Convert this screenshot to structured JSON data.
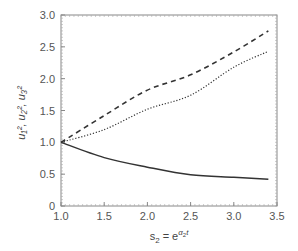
{
  "chart_data": {
    "type": "line",
    "title": "",
    "xlabel": "s2 = e^(α2 t)",
    "ylabel": "u1², u2², u3²",
    "xlim": [
      1.0,
      3.5
    ],
    "ylim": [
      0,
      3.0
    ],
    "xticks": [
      "1.0",
      "1.5",
      "2.0",
      "2.5",
      "3.0",
      "3.5"
    ],
    "yticks": [
      "0",
      "0.5",
      "1.0",
      "1.5",
      "2.0",
      "2.5",
      "3.0"
    ],
    "grid": false,
    "legend": null,
    "x": [
      1.0,
      1.5,
      2.0,
      2.5,
      3.0,
      3.4
    ],
    "series": [
      {
        "name": "dashed",
        "style": "dashed",
        "values": [
          1.0,
          1.42,
          1.82,
          2.06,
          2.42,
          2.75
        ]
      },
      {
        "name": "dotted",
        "style": "dotted",
        "values": [
          1.0,
          1.2,
          1.52,
          1.74,
          2.18,
          2.43
        ]
      },
      {
        "name": "solid",
        "style": "solid",
        "values": [
          1.0,
          0.76,
          0.61,
          0.49,
          0.45,
          0.42
        ]
      }
    ]
  },
  "axes": {
    "xlabel_main": "s",
    "xlabel_sub": "2",
    "xlabel_eq": " = e",
    "xlabel_sup": "α",
    "xlabel_sup_sub": "2",
    "xlabel_sup_t": "t",
    "ylabel_text": "u₁², u₂², u₃²"
  }
}
